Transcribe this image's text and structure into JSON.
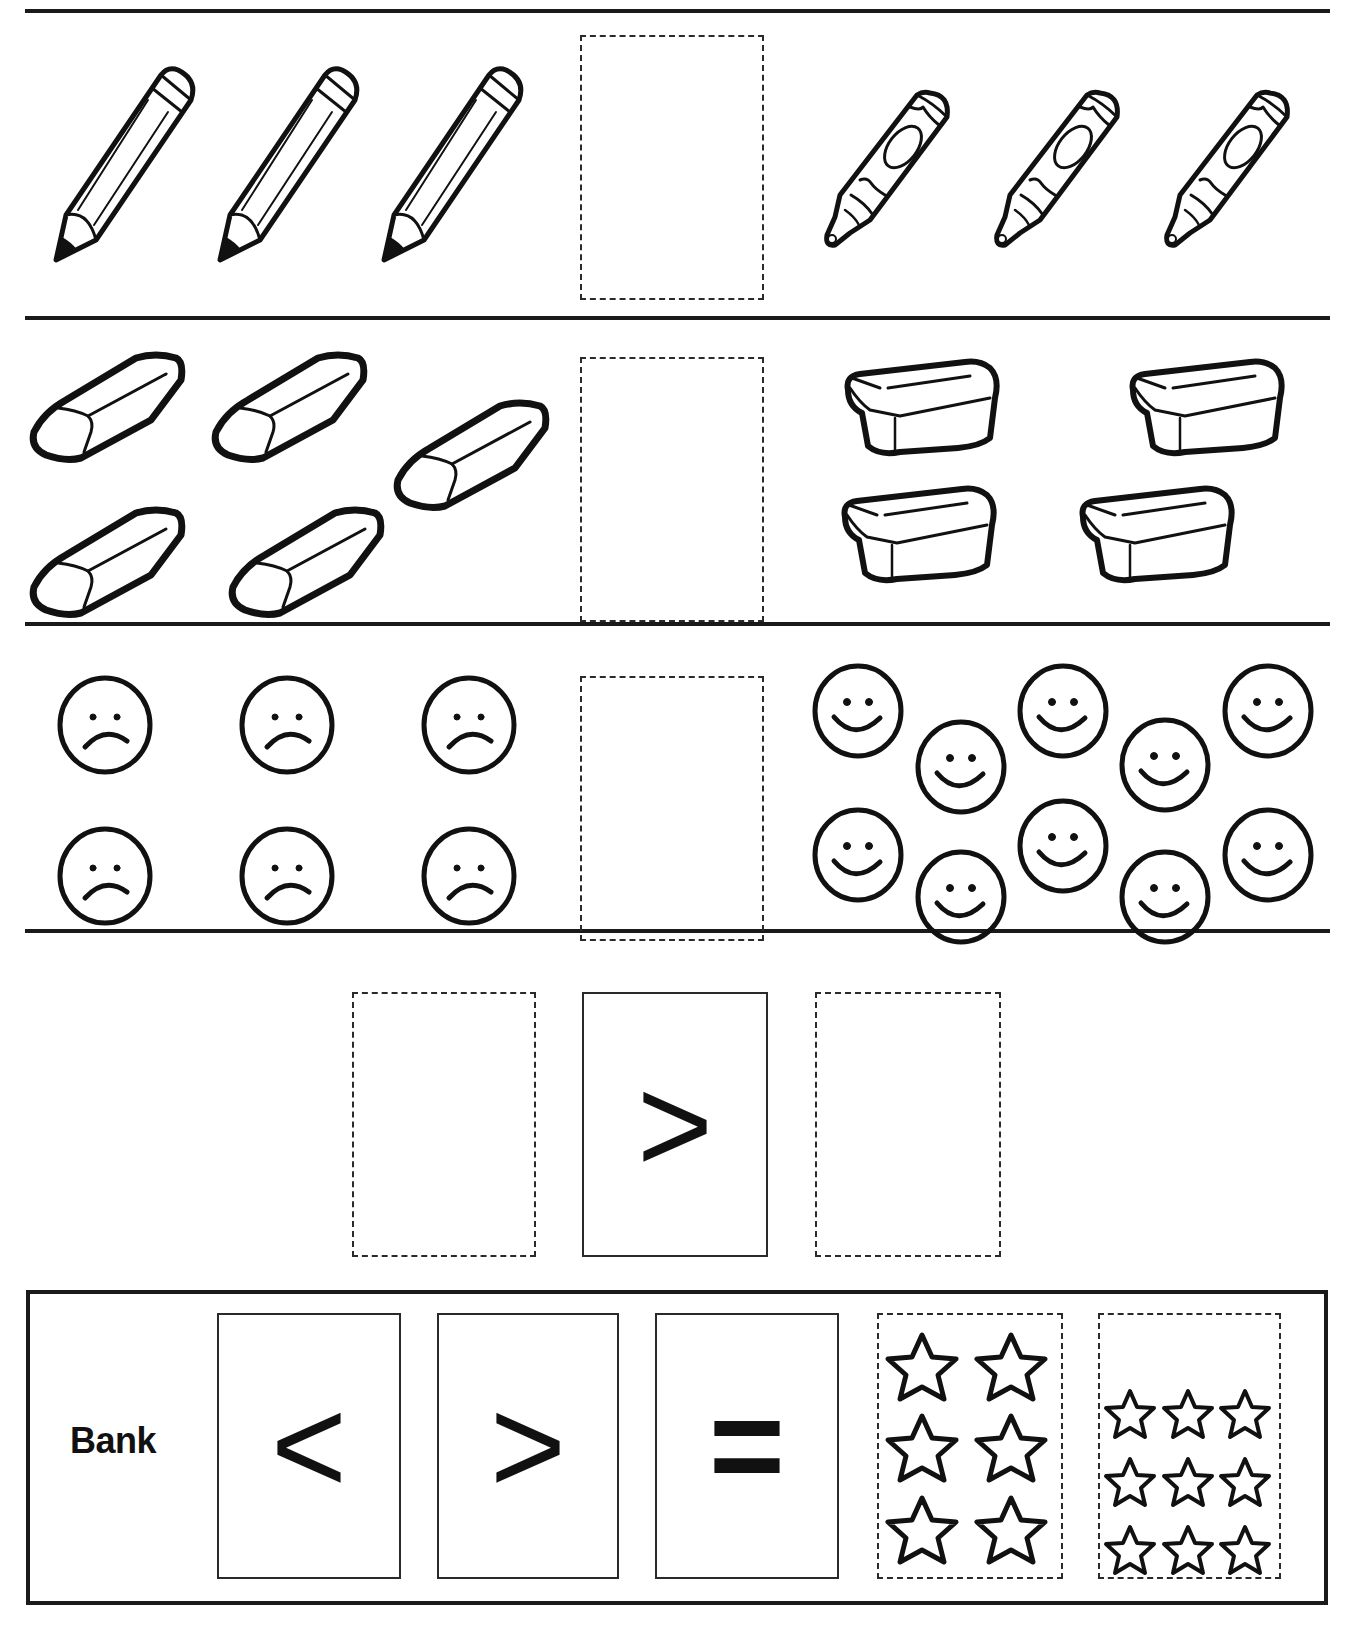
{
  "worksheet": {
    "rows": [
      {
        "id": "row-1",
        "left": {
          "item": "pencil",
          "count": 3
        },
        "right": {
          "item": "crayon",
          "count": 3
        },
        "answer_slot": ""
      },
      {
        "id": "row-2",
        "left": {
          "item": "eraser",
          "count": 5
        },
        "right": {
          "item": "sponge-eraser",
          "count": 4
        },
        "answer_slot": ""
      },
      {
        "id": "row-3",
        "left": {
          "item": "sad-face",
          "count": 6
        },
        "right": {
          "item": "happy-face",
          "count": 10
        },
        "answer_slot": ""
      },
      {
        "id": "row-4",
        "left_slot": "",
        "symbol": ">",
        "right_slot": ""
      }
    ],
    "bank": {
      "label": "Bank",
      "cards": [
        {
          "type": "symbol",
          "value": "<"
        },
        {
          "type": "symbol",
          "value": ">"
        },
        {
          "type": "symbol",
          "value": "="
        },
        {
          "type": "stars",
          "count": 6,
          "layout": "2x3"
        },
        {
          "type": "stars",
          "count": 9,
          "layout": "3x3"
        }
      ]
    }
  }
}
